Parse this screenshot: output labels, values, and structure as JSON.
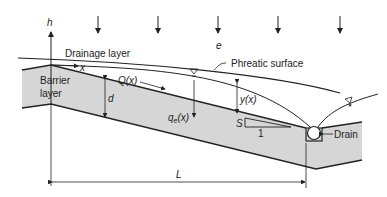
{
  "diagram": {
    "labels": {
      "h_axis": "h",
      "x_axis": "x",
      "infiltration": "e",
      "drainage_layer": "Drainage layer",
      "barrier_layer_line1": "Barrier",
      "barrier_layer_line2": "layer",
      "flow": "Q(x)",
      "thickness": "d",
      "leakage": "q",
      "leakage_sub": "e",
      "leakage_arg": "(x)",
      "head": "y(x)",
      "phreatic_surface": "Phreatic surface",
      "slope": "S",
      "slope_run": "1",
      "drain": "Drain",
      "length": "L"
    },
    "colors": {
      "barrier_fill": "#d6d6d6",
      "line": "#222222"
    }
  }
}
